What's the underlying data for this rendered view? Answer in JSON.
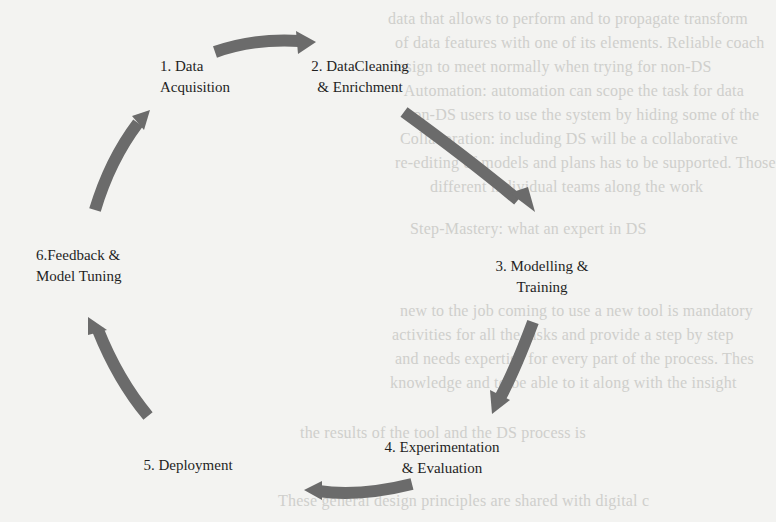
{
  "diagram": {
    "type": "cycle",
    "arrow_color": "#6b6b6b",
    "background_color": "#f3f3f1",
    "stages": [
      {
        "id": 1,
        "line1": "1. Data",
        "line2": "Acquisition"
      },
      {
        "id": 2,
        "line1": "2. DataCleaning",
        "line2": "& Enrichment"
      },
      {
        "id": 3,
        "line1": "3. Modelling &",
        "line2": "Training"
      },
      {
        "id": 4,
        "line1": "4. Experimentation",
        "line2": "& Evaluation"
      },
      {
        "id": 5,
        "line1": "5. Deployment",
        "line2": ""
      },
      {
        "id": 6,
        "line1": "6.Feedback &",
        "line2": "Model Tuning"
      }
    ],
    "flow": [
      "1 → 2",
      "2 → 3",
      "3 → 4",
      "4 → 5",
      "5 → 6",
      "6 → 1"
    ]
  },
  "bleed_through_text": [
    "data that allows to perform and to propagate transform",
    "of data features with one of its elements. Reliable coach",
    "design to meet normally when trying for non-DS",
    "- Automation: automation can scope the task for data",
    "non-DS users to use the system by hiding some of the",
    "Collaboration: including DS will be a collaborative",
    "re-editing of models and plans has to be supported. Those",
    "different individual teams along the work",
    "Step-Mastery: what an expert in DS",
    "new to the job coming to use a new tool is mandatory",
    "activities for all the tasks and provide a step by step",
    "and needs expertise for every part of the process. Thes",
    "knowledge and to be able to it along with the insight",
    "the results of the tool and the DS process is",
    "These general design principles are shared with digital c"
  ]
}
